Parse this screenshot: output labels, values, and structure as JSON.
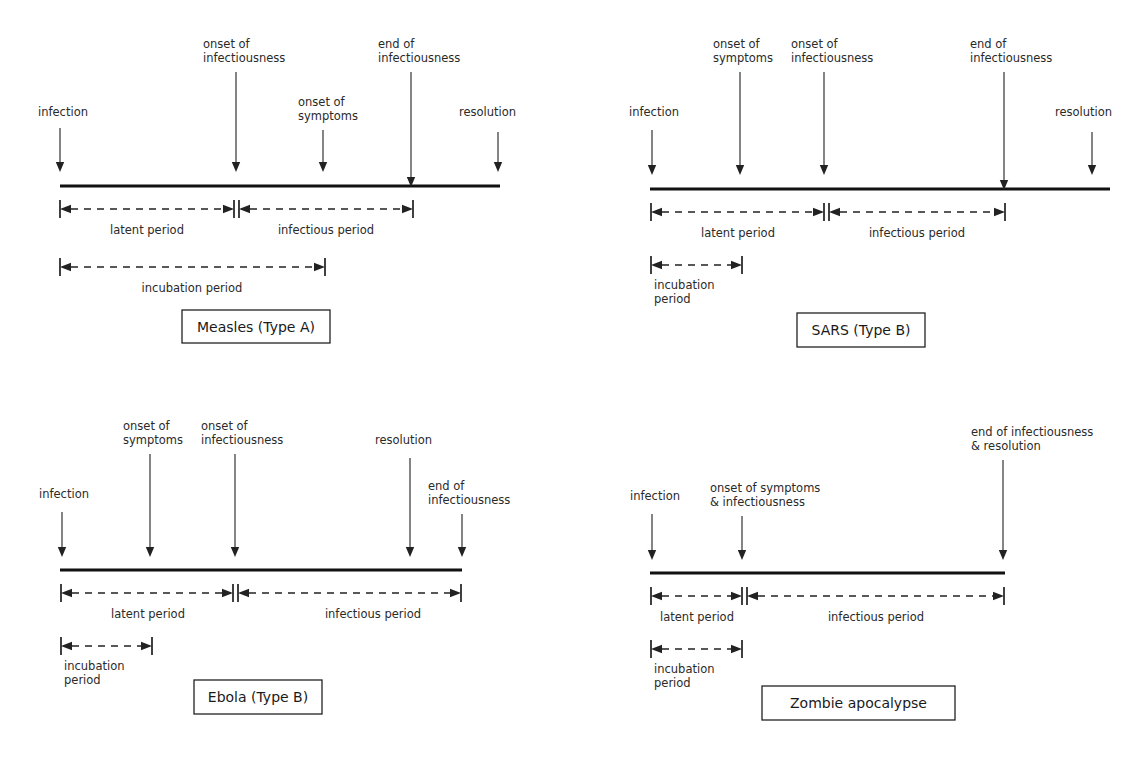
{
  "figure": {
    "background_color": "#ffffff",
    "line_color": "#111111",
    "text_color": "#2a2a2a",
    "width": 1128,
    "height": 757
  },
  "common_labels": {
    "infection": "infection",
    "onset_of_symptoms": "onset of\nsymptoms",
    "onset_of_infectiousness": "onset of\ninfectiousness",
    "end_of_infectiousness": "end of\ninfectiousness",
    "resolution": "resolution",
    "latent_period": "latent period",
    "infectious_period": "infectious period",
    "incubation_period": "incubation period",
    "incubation_period_2line": "incubation\nperiod"
  },
  "panels": [
    {
      "id": "measles",
      "caption": "Measles (Type A)",
      "caption_box": {
        "x": 182,
        "y": 310,
        "w": 148,
        "h": 33
      },
      "axis": {
        "x1": 60,
        "x2": 500,
        "y": 186
      },
      "events": [
        {
          "name": "infection",
          "label": "infection",
          "lines": [
            "infection"
          ],
          "x": 60,
          "label_x": 38,
          "label_anchor": "start",
          "label_y": 116,
          "arrow_top": 128,
          "arrow_bottom": 172
        },
        {
          "name": "onset-of-infectiousness",
          "label": "onset of infectiousness",
          "lines": [
            "onset of",
            "infectiousness"
          ],
          "x": 236,
          "label_x": 203,
          "label_anchor": "start",
          "label_y": 48,
          "arrow_top": 72,
          "arrow_bottom": 172
        },
        {
          "name": "onset-of-symptoms",
          "label": "onset of symptoms",
          "lines": [
            "onset of",
            "symptoms"
          ],
          "x": 323,
          "label_x": 298,
          "label_anchor": "start",
          "label_y": 106,
          "arrow_top": 130,
          "arrow_bottom": 172
        },
        {
          "name": "end-of-infectiousness",
          "label": "end of infectiousness",
          "lines": [
            "end of",
            "infectiousness"
          ],
          "x": 411,
          "label_x": 378,
          "label_anchor": "start",
          "label_y": 48,
          "arrow_top": 72,
          "arrow_bottom": 187
        },
        {
          "name": "resolution",
          "label": "resolution",
          "lines": [
            "resolution"
          ],
          "x": 498,
          "label_x": 459,
          "label_anchor": "start",
          "label_y": 116,
          "arrow_top": 132,
          "arrow_bottom": 172
        }
      ],
      "spans": [
        {
          "name": "latent-period",
          "label": "latent period",
          "x1": 60,
          "x2": 234,
          "y": 209,
          "label_x": 147,
          "label_y": 234
        },
        {
          "name": "infectious-period",
          "label": "infectious period",
          "x1": 239,
          "x2": 413,
          "y": 209,
          "label_x": 326,
          "label_y": 234
        },
        {
          "name": "incubation-period",
          "label": "incubation period",
          "x1": 60,
          "x2": 325,
          "y": 267,
          "label_x": 192,
          "label_y": 292
        }
      ]
    },
    {
      "id": "sars",
      "caption": "SARS (Type B)",
      "caption_box": {
        "x": 797,
        "y": 313,
        "w": 128,
        "h": 34
      },
      "axis": {
        "x1": 650,
        "x2": 1110,
        "y": 189
      },
      "events": [
        {
          "name": "infection",
          "label": "infection",
          "lines": [
            "infection"
          ],
          "x": 652,
          "label_x": 629,
          "label_anchor": "start",
          "label_y": 116,
          "arrow_top": 130,
          "arrow_bottom": 175
        },
        {
          "name": "onset-of-symptoms",
          "label": "onset of symptoms",
          "lines": [
            "onset of",
            "symptoms"
          ],
          "x": 740,
          "label_x": 713,
          "label_anchor": "start",
          "label_y": 48,
          "arrow_top": 72,
          "arrow_bottom": 175
        },
        {
          "name": "onset-of-infectiousness",
          "label": "onset of infectiousness",
          "lines": [
            "onset of",
            "infectiousness"
          ],
          "x": 824,
          "label_x": 791,
          "label_anchor": "start",
          "label_y": 48,
          "arrow_top": 72,
          "arrow_bottom": 175
        },
        {
          "name": "end-of-infectiousness",
          "label": "end of infectiousness",
          "lines": [
            "end of",
            "infectiousness"
          ],
          "x": 1004,
          "label_x": 970,
          "label_anchor": "start",
          "label_y": 48,
          "arrow_top": 72,
          "arrow_bottom": 190
        },
        {
          "name": "resolution",
          "label": "resolution",
          "lines": [
            "resolution"
          ],
          "x": 1092,
          "label_x": 1055,
          "label_anchor": "start",
          "label_y": 116,
          "arrow_top": 132,
          "arrow_bottom": 175
        }
      ],
      "spans": [
        {
          "name": "latent-period",
          "label": "latent period",
          "x1": 651,
          "x2": 824,
          "y": 212,
          "label_x": 738,
          "label_y": 237
        },
        {
          "name": "infectious-period",
          "label": "infectious period",
          "x1": 829,
          "x2": 1005,
          "y": 212,
          "label_x": 917,
          "label_y": 237
        },
        {
          "name": "incubation-period",
          "label": "incubation\nperiod",
          "lines": [
            "incubation",
            "period"
          ],
          "x1": 651,
          "x2": 742,
          "y": 265,
          "label_x": 654,
          "label_y": 289,
          "label_anchor": "start",
          "multiline": true
        }
      ]
    },
    {
      "id": "ebola",
      "caption": "Ebola (Type B)",
      "caption_box": {
        "x": 194,
        "y": 680,
        "w": 128,
        "h": 34
      },
      "axis": {
        "x1": 60,
        "x2": 462,
        "y": 570
      },
      "events": [
        {
          "name": "infection",
          "label": "infection",
          "lines": [
            "infection"
          ],
          "x": 62,
          "label_x": 39,
          "label_anchor": "start",
          "label_y": 498,
          "arrow_top": 512,
          "arrow_bottom": 557
        },
        {
          "name": "onset-of-symptoms",
          "label": "onset of symptoms",
          "lines": [
            "onset of",
            "symptoms"
          ],
          "x": 150,
          "label_x": 123,
          "label_anchor": "start",
          "label_y": 430,
          "arrow_top": 454,
          "arrow_bottom": 557
        },
        {
          "name": "onset-of-infectiousness",
          "label": "onset of infectiousness",
          "lines": [
            "onset of",
            "infectiousness"
          ],
          "x": 235,
          "label_x": 201,
          "label_anchor": "start",
          "label_y": 430,
          "arrow_top": 454,
          "arrow_bottom": 557
        },
        {
          "name": "resolution",
          "label": "resolution",
          "lines": [
            "resolution"
          ],
          "x": 410,
          "label_x": 375,
          "label_anchor": "start",
          "label_y": 444,
          "arrow_top": 458,
          "arrow_bottom": 557
        },
        {
          "name": "end-of-infectiousness",
          "label": "end of infectiousness",
          "lines": [
            "end of",
            "infectiousness"
          ],
          "x": 462,
          "label_x": 428,
          "label_anchor": "start",
          "label_y": 490,
          "arrow_top": 514,
          "arrow_bottom": 557
        }
      ],
      "spans": [
        {
          "name": "latent-period",
          "label": "latent period",
          "x1": 61,
          "x2": 233,
          "y": 593,
          "label_x": 148,
          "label_y": 618
        },
        {
          "name": "infectious-period",
          "label": "infectious period",
          "x1": 238,
          "x2": 461,
          "y": 593,
          "label_x": 373,
          "label_y": 618
        },
        {
          "name": "incubation-period",
          "label": "incubation\nperiod",
          "lines": [
            "incubation",
            "period"
          ],
          "x1": 61,
          "x2": 152,
          "y": 646,
          "label_x": 64,
          "label_y": 670,
          "label_anchor": "start",
          "multiline": true
        }
      ]
    },
    {
      "id": "zombie",
      "caption": "Zombie apocalypse",
      "caption_box": {
        "x": 762,
        "y": 686,
        "w": 193,
        "h": 34
      },
      "axis": {
        "x1": 650,
        "x2": 1005,
        "y": 573
      },
      "events": [
        {
          "name": "infection",
          "label": "infection",
          "lines": [
            "infection"
          ],
          "x": 652,
          "label_x": 630,
          "label_anchor": "start",
          "label_y": 500,
          "arrow_top": 514,
          "arrow_bottom": 560
        },
        {
          "name": "onset-of-symptoms-and-infectiousness",
          "label": "onset of symptoms & infectiousness",
          "lines": [
            "onset of symptoms",
            "& infectiousness"
          ],
          "x": 742,
          "label_x": 710,
          "label_anchor": "start",
          "label_y": 492,
          "arrow_top": 516,
          "arrow_bottom": 560
        },
        {
          "name": "end-of-infectiousness-and-resolution",
          "label": "end of infectiousness & resolution",
          "lines": [
            "end of infectiousness",
            "& resolution"
          ],
          "x": 1003,
          "label_x": 971,
          "label_anchor": "start",
          "label_y": 436,
          "arrow_top": 460,
          "arrow_bottom": 560
        }
      ],
      "spans": [
        {
          "name": "latent-period",
          "label": "latent period",
          "x1": 651,
          "x2": 742,
          "y": 596,
          "label_x": 697,
          "label_y": 621
        },
        {
          "name": "infectious-period",
          "label": "infectious period",
          "x1": 747,
          "x2": 1004,
          "y": 596,
          "label_x": 876,
          "label_y": 621
        },
        {
          "name": "incubation-period",
          "label": "incubation\nperiod",
          "lines": [
            "incubation",
            "period"
          ],
          "x1": 651,
          "x2": 742,
          "y": 649,
          "label_x": 654,
          "label_y": 673,
          "label_anchor": "start",
          "multiline": true
        }
      ]
    }
  ]
}
